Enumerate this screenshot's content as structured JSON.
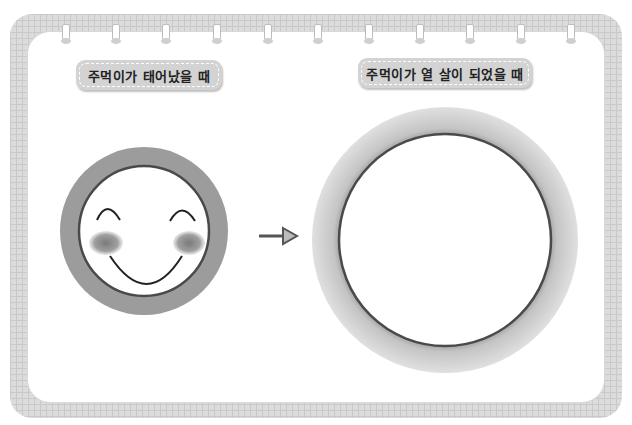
{
  "labels": {
    "left": "주먹이가 태어났을 때",
    "right": "주먹이가 열 살이 되었을 때"
  },
  "illustrations": {
    "left": "smiling-face-in-gray-ring",
    "arrow": "right-arrow",
    "right": "empty-large-circle"
  },
  "colors": {
    "frame": "#dcdcdc",
    "label_bg": "#d3d3d3",
    "ring_small": "#9a9a9a",
    "ring_large": "#c8c8c8",
    "blush": "#8c8c8c"
  }
}
